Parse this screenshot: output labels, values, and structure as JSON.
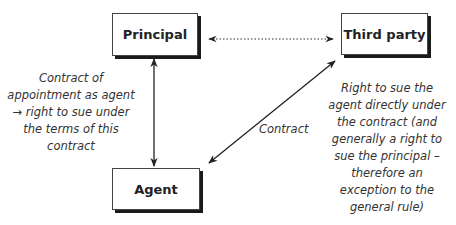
{
  "diagram": {
    "nodes": {
      "principal": "Principal",
      "third_party": "Third party",
      "agent": "Agent"
    },
    "edges": {
      "principal_third_party": {
        "style": "dotted",
        "direction": "both",
        "label": ""
      },
      "principal_agent": {
        "style": "solid",
        "direction": "both",
        "label": ""
      },
      "agent_third_party": {
        "style": "solid",
        "direction": "both",
        "label": "Contract"
      }
    },
    "notes": {
      "left": [
        "Contract of",
        "appointment as agent",
        "→ right to sue under",
        "the terms of this",
        "contract"
      ],
      "right": [
        "Right to sue the",
        "agent directly under",
        "the contract (and",
        "generally a right to",
        "sue the principal –",
        "therefore an",
        "exception to the",
        "general rule)"
      ]
    },
    "colors": {
      "line": "#222222",
      "shadow": "#1a1a1a",
      "text": "#333333"
    }
  }
}
